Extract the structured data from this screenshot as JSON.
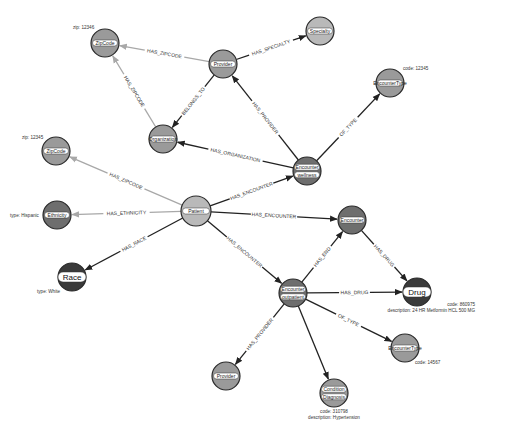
{
  "colors": {
    "light_node": "#b9b9b9",
    "mid_node": "#9a9a9a",
    "dark_node": "#6e6e6e",
    "darkest_node": "#3a3a3a",
    "edge_dark": "#222222",
    "edge_light": "#a8a8a8"
  },
  "nodes": [
    {
      "id": "zip1",
      "labels": [
        "ZipCode"
      ],
      "x": 105,
      "y": 43,
      "r": 14,
      "fill": "mid_node",
      "props": [
        "zip: 12346"
      ],
      "props_pos": [
        73,
        29
      ],
      "props_anchor": "start"
    },
    {
      "id": "provider1",
      "labels": [
        "Provider"
      ],
      "x": 223,
      "y": 64,
      "r": 14,
      "fill": "mid_node",
      "props": []
    },
    {
      "id": "specialty",
      "labels": [
        "Specialty"
      ],
      "x": 320,
      "y": 31,
      "r": 14,
      "fill": "light_node",
      "props": []
    },
    {
      "id": "org",
      "labels": [
        "Organization"
      ],
      "x": 163,
      "y": 139,
      "r": 14,
      "fill": "mid_node",
      "props": []
    },
    {
      "id": "enctype1",
      "labels": [
        "EncounterType"
      ],
      "x": 390,
      "y": 83,
      "r": 14,
      "fill": "mid_node",
      "props": [
        "code: 12345"
      ],
      "props_pos": [
        403,
        70
      ],
      "props_anchor": "start"
    },
    {
      "id": "enc_wellness",
      "labels": [
        "Encounter",
        "wellness"
      ],
      "x": 307,
      "y": 171,
      "r": 14,
      "fill": "dark_node",
      "props": []
    },
    {
      "id": "zip2",
      "labels": [
        "ZipCode"
      ],
      "x": 56,
      "y": 151,
      "r": 14,
      "fill": "mid_node",
      "props": [
        "zip: 12345"
      ],
      "props_pos": [
        22,
        139
      ],
      "props_anchor": "start"
    },
    {
      "id": "patient",
      "labels": [
        "Patient"
      ],
      "x": 196,
      "y": 211,
      "r": 15,
      "fill": "light_node",
      "props": []
    },
    {
      "id": "ethnicity",
      "labels": [
        "Ethnicity"
      ],
      "x": 57,
      "y": 215,
      "r": 14,
      "fill": "dark_node",
      "props": [
        "type: Hispanic"
      ],
      "props_pos": [
        10,
        217
      ],
      "props_anchor": "start"
    },
    {
      "id": "race",
      "labels": [
        "Race"
      ],
      "x": 72,
      "y": 277,
      "r": 14,
      "fill": "darkest_node",
      "big": true,
      "props": [
        "type: White"
      ],
      "props_pos": [
        37,
        293
      ],
      "props_anchor": "start"
    },
    {
      "id": "encounter",
      "labels": [
        "Encounter"
      ],
      "x": 352,
      "y": 220,
      "r": 14,
      "fill": "dark_node",
      "props": []
    },
    {
      "id": "enc_outpatient",
      "labels": [
        "Encounter",
        "outpatient"
      ],
      "x": 293,
      "y": 293,
      "r": 14,
      "fill": "dark_node",
      "props": []
    },
    {
      "id": "drug",
      "labels": [
        "Drug"
      ],
      "x": 417,
      "y": 292,
      "r": 14,
      "fill": "darkest_node",
      "big": true,
      "props": [
        "code: 860975",
        "description: 24 HR Metformin HCL 500 MG"
      ],
      "props_pos": [
        475,
        306
      ],
      "props_anchor": "end"
    },
    {
      "id": "enctype2",
      "labels": [
        "EncounterType"
      ],
      "x": 405,
      "y": 348,
      "r": 14,
      "fill": "mid_node",
      "props": [
        "code: 14567"
      ],
      "props_pos": [
        415,
        364
      ],
      "props_anchor": "start"
    },
    {
      "id": "provider2",
      "labels": [
        "Provider"
      ],
      "x": 226,
      "y": 376,
      "r": 14,
      "fill": "mid_node",
      "props": []
    },
    {
      "id": "condition",
      "labels": [
        "Condition",
        "Diagnosis"
      ],
      "x": 334,
      "y": 393,
      "r": 14,
      "fill": "mid_node",
      "props": [
        "code: 310798",
        "description: Hypertension"
      ],
      "props_pos": [
        334,
        413
      ],
      "props_anchor": "middle"
    }
  ],
  "edges": [
    {
      "from": "provider1",
      "to": "zip1",
      "label": "HAS_ZIPCODE",
      "style": "edge_light"
    },
    {
      "from": "provider1",
      "to": "specialty",
      "label": "HAS_SPECIALTY",
      "style": "edge_dark"
    },
    {
      "from": "provider1",
      "to": "org",
      "label": "BELONGS_TO",
      "style": "edge_dark"
    },
    {
      "from": "org",
      "to": "zip1",
      "label": "HAS_ZIPCODE",
      "style": "edge_light"
    },
    {
      "from": "enc_wellness",
      "to": "provider1",
      "label": "HAS_PROVIDER",
      "style": "edge_dark"
    },
    {
      "from": "enc_wellness",
      "to": "org",
      "label": "HAS_ORGANIZATION",
      "style": "edge_dark"
    },
    {
      "from": "enc_wellness",
      "to": "enctype1",
      "label": "OF_TYPE",
      "style": "edge_dark"
    },
    {
      "from": "patient",
      "to": "enc_wellness",
      "label": "HAS_ENCOUNTER",
      "style": "edge_dark"
    },
    {
      "from": "patient",
      "to": "zip2",
      "label": "HAS_ZIPCODE",
      "style": "edge_light"
    },
    {
      "from": "patient",
      "to": "ethnicity",
      "label": "HAS_ETHNICITY",
      "style": "edge_light"
    },
    {
      "from": "patient",
      "to": "race",
      "label": "HAS_RACE",
      "style": "edge_dark"
    },
    {
      "from": "patient",
      "to": "encounter",
      "label": "HAS_ENCOUNTER",
      "style": "edge_dark"
    },
    {
      "from": "patient",
      "to": "enc_outpatient",
      "label": "HAS_ENCOUNTER",
      "style": "edge_dark"
    },
    {
      "from": "enc_outpatient",
      "to": "encounter",
      "label": "HAS_END",
      "style": "edge_dark"
    },
    {
      "from": "encounter",
      "to": "drug",
      "label": "HAS_DRUG",
      "style": "edge_dark"
    },
    {
      "from": "enc_outpatient",
      "to": "drug",
      "label": "HAS_DRUG",
      "style": "edge_dark"
    },
    {
      "from": "enc_outpatient",
      "to": "enctype2",
      "label": "OF_TYPE",
      "style": "edge_dark"
    },
    {
      "from": "enc_outpatient",
      "to": "provider2",
      "label": "HAS_PROVIDER",
      "style": "edge_dark"
    },
    {
      "from": "enc_outpatient",
      "to": "condition",
      "label": "",
      "style": "edge_dark"
    }
  ]
}
